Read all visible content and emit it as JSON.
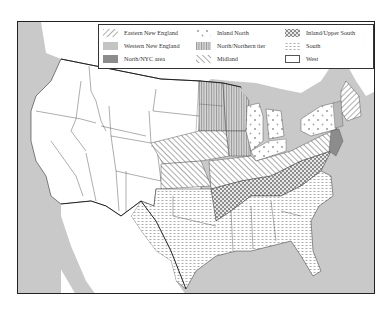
{
  "map": {
    "title": "Dialect regions of the United States",
    "colors": {
      "water": "#c9c9c9",
      "land": "#ffffff",
      "border": "#333333",
      "western_new_england": "#b8b8b8",
      "north_nyc": "#8c8c8c"
    },
    "legend": {
      "items": [
        {
          "label": "Eastern New England",
          "pattern": "diagonal-hatch-right",
          "column": 0,
          "row": 0
        },
        {
          "label": "Western New England",
          "pattern": "light-gray-solid",
          "column": 0,
          "row": 1
        },
        {
          "label": "North/NYC area",
          "pattern": "dark-gray-solid",
          "column": 0,
          "row": 2
        },
        {
          "label": "Inland North",
          "pattern": "dots",
          "column": 1,
          "row": 0
        },
        {
          "label": "North/Northern tier",
          "pattern": "vertical-lines",
          "column": 1,
          "row": 1
        },
        {
          "label": "Midland",
          "pattern": "diagonal-hatch-left",
          "column": 1,
          "row": 2
        },
        {
          "label": "Inland/Upper South",
          "pattern": "crosshatch",
          "column": 2,
          "row": 0
        },
        {
          "label": "South",
          "pattern": "dashes",
          "column": 2,
          "row": 1
        },
        {
          "label": "West",
          "pattern": "white",
          "column": 2,
          "row": 2
        }
      ]
    }
  }
}
